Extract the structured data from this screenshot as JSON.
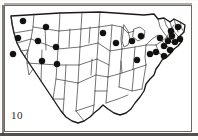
{
  "figure": {
    "label": "10",
    "caption_text": "10",
    "type": "dot-distribution-map",
    "region": "United States",
    "background_color": "#ffffff",
    "dot_color": "#121110",
    "outline_color": "#1c1a19",
    "border_color": "#55524e"
  },
  "map_data": {
    "type": "point-map",
    "projection_hint": "contiguous-united-states",
    "viewbox": [
      0,
      0,
      188,
      127
    ],
    "symbol": {
      "shape": "filled-circle",
      "radius_px": 3.1,
      "meaning": "occurrence record"
    },
    "dots": [
      {
        "id": "d01",
        "x": 19,
        "y": 16,
        "area": "pacific-northwest"
      },
      {
        "id": "d02",
        "x": 42,
        "y": 22,
        "area": "northern-rockies"
      },
      {
        "id": "d03",
        "x": 14,
        "y": 33,
        "area": "great-basin-northwest"
      },
      {
        "id": "d04",
        "x": 34,
        "y": 36,
        "area": "northern-rockies-south"
      },
      {
        "id": "d05",
        "x": 9,
        "y": 49,
        "area": "pacific-southwest"
      },
      {
        "id": "d06",
        "x": 52,
        "y": 42,
        "area": "central-rockies"
      },
      {
        "id": "d07",
        "x": 38,
        "y": 56,
        "area": "great-basin-south"
      },
      {
        "id": "d08",
        "x": 53,
        "y": 59,
        "area": "southern-rockies-west"
      },
      {
        "id": "d09",
        "x": 99,
        "y": 28,
        "area": "upper-midwest-west"
      },
      {
        "id": "d10",
        "x": 112,
        "y": 38,
        "area": "upper-midwest"
      },
      {
        "id": "d11",
        "x": 128,
        "y": 36,
        "area": "great-lakes-west"
      },
      {
        "id": "d12",
        "x": 133,
        "y": 55,
        "area": "great-lakes-south"
      },
      {
        "id": "d13",
        "x": 146,
        "y": 49,
        "area": "ohio-valley-east"
      },
      {
        "id": "d14",
        "x": 137,
        "y": 31,
        "area": "great-lakes-north"
      },
      {
        "id": "d15",
        "x": 152,
        "y": 47,
        "area": "mid-atlantic-west"
      },
      {
        "id": "d16",
        "x": 160,
        "y": 51,
        "area": "mid-atlantic"
      },
      {
        "id": "d17",
        "x": 156,
        "y": 33,
        "area": "northeast-interior"
      },
      {
        "id": "d18",
        "x": 164,
        "y": 36,
        "area": "northeast"
      },
      {
        "id": "d19",
        "x": 168,
        "y": 31,
        "area": "northeast-upper"
      },
      {
        "id": "d20",
        "x": 171,
        "y": 37,
        "area": "new-england-south"
      },
      {
        "id": "d21",
        "x": 176,
        "y": 34,
        "area": "new-england-coast"
      },
      {
        "id": "d22",
        "x": 174,
        "y": 22,
        "area": "northern-new-england"
      },
      {
        "id": "d23",
        "x": 167,
        "y": 26,
        "area": "new-england-interior"
      },
      {
        "id": "d24",
        "x": 160,
        "y": 41,
        "area": "mid-atlantic-north"
      },
      {
        "id": "d25",
        "x": 166,
        "y": 45,
        "area": "coastal-mid-atlantic"
      }
    ],
    "empty_regions": [
      "south",
      "southeast",
      "gulf-coast",
      "southern-plains",
      "florida"
    ],
    "total_dots": 25
  }
}
